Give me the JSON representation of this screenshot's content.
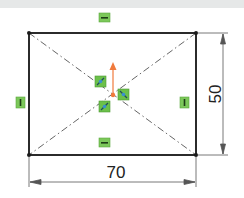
{
  "sketch": {
    "rectangle": {
      "corners": [
        [
          29,
          33
        ],
        [
          196,
          33
        ],
        [
          196,
          155
        ],
        [
          29,
          155
        ]
      ],
      "stroke": "#2b2b2b"
    },
    "centerlines": [
      {
        "from": [
          29,
          33
        ],
        "to": [
          196,
          155
        ]
      },
      {
        "from": [
          196,
          33
        ],
        "to": [
          29,
          155
        ]
      }
    ],
    "origin": {
      "x": 113,
      "y": 95,
      "arrow_tip_y": 64,
      "color": "#f07a3c"
    },
    "relations": [
      {
        "type": "horizontal",
        "x": 104,
        "y": 17
      },
      {
        "type": "horizontal",
        "x": 104,
        "y": 142
      },
      {
        "type": "vertical",
        "x": 21,
        "y": 102
      },
      {
        "type": "vertical",
        "x": 184,
        "y": 102
      },
      {
        "type": "midpoint",
        "x": 100,
        "y": 81
      },
      {
        "type": "midpoint",
        "x": 123,
        "y": 95
      },
      {
        "type": "midpoint",
        "x": 104,
        "y": 106
      }
    ],
    "relation_color": "#6cc04a",
    "dimensions": {
      "width": {
        "label": "70",
        "value": 70
      },
      "height": {
        "label": "50",
        "value": 50
      }
    }
  }
}
